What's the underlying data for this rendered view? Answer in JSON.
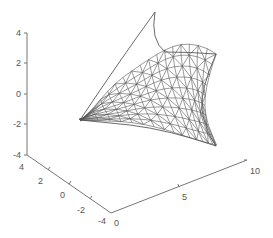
{
  "chart_data": {
    "type": "surface-mesh",
    "title": "",
    "xlabel": "",
    "ylabel": "",
    "zlabel": "",
    "x_ticks": [
      "0",
      "5",
      "10"
    ],
    "y_ticks": [
      "4",
      "2",
      "0",
      "-2",
      "-4"
    ],
    "z_ticks": [
      "4",
      "2",
      "0",
      "-2",
      "-4"
    ],
    "xlim": [
      0,
      10
    ],
    "ylim": [
      -4,
      4
    ],
    "zlim": [
      -4,
      4
    ],
    "grid": false,
    "legend": null,
    "mesh_color": "#555555",
    "axis_color": "#777777"
  }
}
